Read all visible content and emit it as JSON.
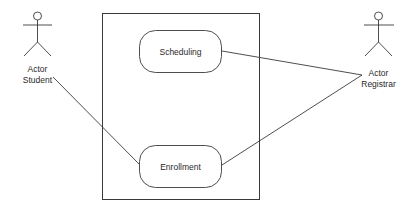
{
  "diagram": {
    "type": "uml-use-case",
    "colors": {
      "background": "#ffffff",
      "stroke": "#3a3a3a",
      "text": "#2a2a2a"
    },
    "system_boundary": {
      "label": ""
    },
    "actors": [
      {
        "id": "student",
        "line1": "Actor",
        "line2": "Student"
      },
      {
        "id": "registrar",
        "line1": "Actor",
        "line2": "Registrar"
      }
    ],
    "use_cases": [
      {
        "id": "scheduling",
        "label": "Scheduling"
      },
      {
        "id": "enrollment",
        "label": "Enrollment"
      }
    ],
    "associations": [
      {
        "from": "student",
        "to": "enrollment"
      },
      {
        "from": "registrar",
        "to": "scheduling"
      },
      {
        "from": "registrar",
        "to": "enrollment"
      }
    ]
  }
}
